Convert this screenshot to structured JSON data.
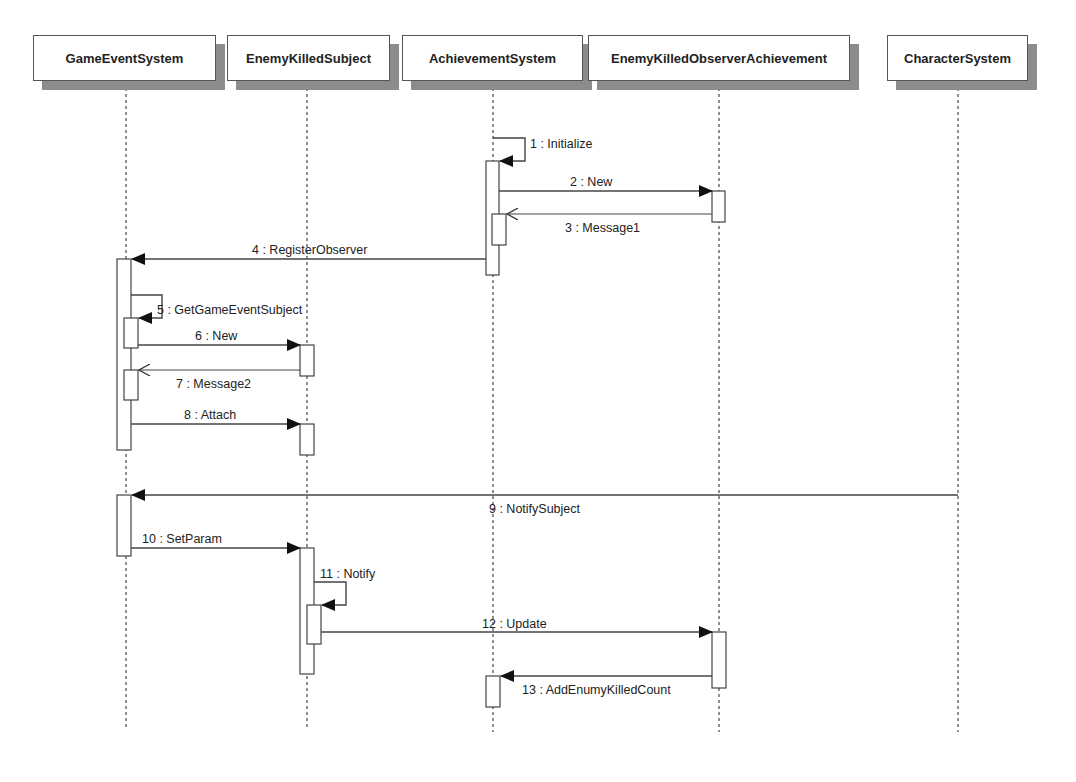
{
  "diagram": {
    "type": "UML sequence diagram",
    "lifelines": [
      {
        "id": "ges",
        "name": "GameEventSystem",
        "x": 126,
        "box_left": 33,
        "box_width": 183
      },
      {
        "id": "eks",
        "name": "EnemyKilledSubject",
        "x": 307,
        "box_left": 227,
        "box_width": 163
      },
      {
        "id": "as",
        "name": "AchievementSystem",
        "x": 493,
        "box_left": 402,
        "box_width": 181
      },
      {
        "id": "ekoa",
        "name": "EnemyKilledObserverAchievement",
        "x": 719,
        "box_left": 588,
        "box_width": 262
      },
      {
        "id": "cs",
        "name": "CharacterSystem",
        "x": 958,
        "box_left": 887,
        "box_width": 141
      }
    ],
    "messages": [
      {
        "n": 1,
        "label": "1 : Initialize",
        "from": "as",
        "to": "as",
        "kind": "self-sync"
      },
      {
        "n": 2,
        "label": "2 : New",
        "from": "as",
        "to": "ekoa",
        "kind": "sync"
      },
      {
        "n": 3,
        "label": "3 : Message1",
        "from": "ekoa",
        "to": "as",
        "kind": "return"
      },
      {
        "n": 4,
        "label": "4 : RegisterObserver",
        "from": "as",
        "to": "ges",
        "kind": "sync"
      },
      {
        "n": 5,
        "label": "5 : GetGameEventSubject",
        "from": "ges",
        "to": "ges",
        "kind": "self-sync"
      },
      {
        "n": 6,
        "label": "6 : New",
        "from": "ges",
        "to": "eks",
        "kind": "sync"
      },
      {
        "n": 7,
        "label": "7 : Message2",
        "from": "eks",
        "to": "ges",
        "kind": "return"
      },
      {
        "n": 8,
        "label": "8 : Attach",
        "from": "ges",
        "to": "eks",
        "kind": "sync"
      },
      {
        "n": 9,
        "label": "9 : NotifySubject",
        "from": "cs",
        "to": "ges",
        "kind": "sync"
      },
      {
        "n": 10,
        "label": "10 : SetParam",
        "from": "ges",
        "to": "eks",
        "kind": "sync"
      },
      {
        "n": 11,
        "label": "11 : Notify",
        "from": "eks",
        "to": "eks",
        "kind": "self-sync"
      },
      {
        "n": 12,
        "label": "12 : Update",
        "from": "eks",
        "to": "ekoa",
        "kind": "sync"
      },
      {
        "n": 13,
        "label": "13 : AddEnumyKilledCount",
        "from": "ekoa",
        "to": "as",
        "kind": "sync"
      }
    ]
  },
  "labels": {
    "m1": "1 : Initialize",
    "m2": "2 : New",
    "m3": "3 : Message1",
    "m4": "4 : RegisterObserver",
    "m5": "5 : GetGameEventSubject",
    "m6": "6 : New",
    "m7": "7 : Message2",
    "m8": "8 : Attach",
    "m9": "9 : NotifySubject",
    "m10": "10 : SetParam",
    "m11": "11 : Notify",
    "m12": "12 : Update",
    "m13": "13 : AddEnumyKilledCount"
  },
  "heads": {
    "ges": "GameEventSystem",
    "eks": "EnemyKilledSubject",
    "as": "AchievementSystem",
    "ekoa": "EnemyKilledObserverAchievement",
    "cs": "CharacterSystem"
  },
  "colors": {
    "line": "#444444",
    "shadow": "#8c8c8c",
    "text": "#222222",
    "background": "#ffffff"
  }
}
